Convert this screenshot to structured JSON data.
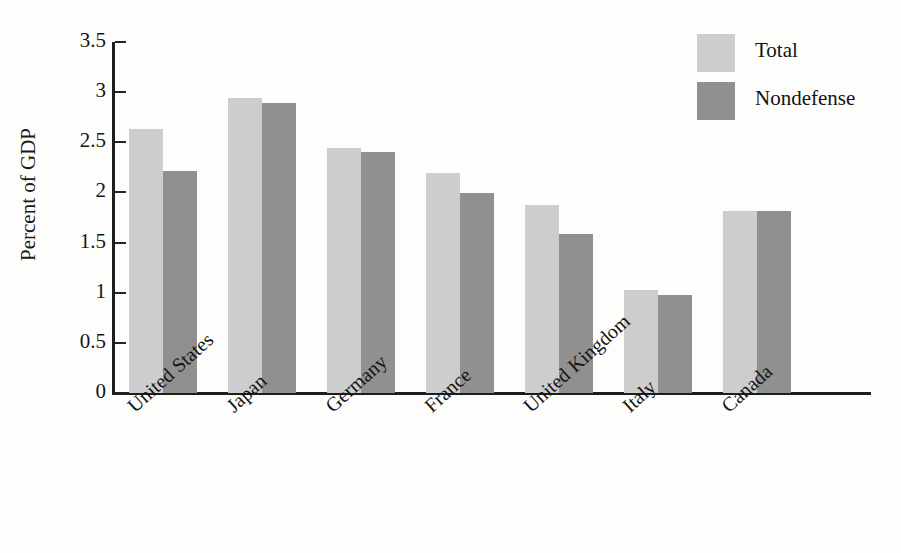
{
  "chart_data": {
    "type": "bar",
    "title": "",
    "xlabel": "",
    "ylabel": "Percent of GDP",
    "ylim": [
      0,
      3.5
    ],
    "ytick_labels": [
      "3.5",
      "3",
      "2.5",
      "2",
      "1.5",
      "1",
      "0.5",
      "0"
    ],
    "ytick_values": [
      3.5,
      3,
      2.5,
      2,
      1.5,
      1,
      0.5,
      0
    ],
    "grid": false,
    "legend_position": "top-right",
    "categories": [
      "United States",
      "Japan",
      "Germany",
      "France",
      "United Kingdom",
      "Italy",
      "Canada"
    ],
    "series": [
      {
        "name": "Total",
        "color": "#cdcdcd",
        "values": [
          2.63,
          2.94,
          2.44,
          2.19,
          1.87,
          1.03,
          1.81
        ]
      },
      {
        "name": "Nondefense",
        "color": "#909090",
        "values": [
          2.21,
          2.89,
          2.4,
          1.99,
          1.59,
          0.98,
          1.81
        ]
      }
    ]
  }
}
